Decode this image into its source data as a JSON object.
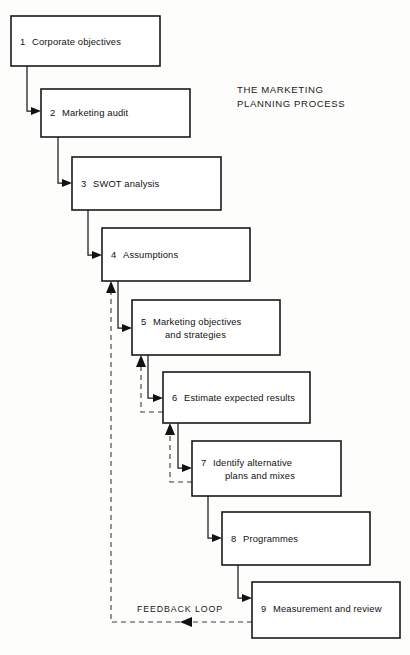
{
  "figure": {
    "title_line1": "THE MARKETING",
    "title_line2": "PLANNING PROCESS",
    "feedback_label": "FEEDBACK LOOP",
    "ink_color": "#1a1a1a",
    "background_color": "#fdfdfc"
  },
  "steps": [
    {
      "number": "1",
      "line1": "Corporate objectives",
      "line2": ""
    },
    {
      "number": "2",
      "line1": "Marketing audit",
      "line2": ""
    },
    {
      "number": "3",
      "line1": "SWOT analysis",
      "line2": ""
    },
    {
      "number": "4",
      "line1": "Assumptions",
      "line2": ""
    },
    {
      "number": "5",
      "line1": "Marketing objectives",
      "line2": "and strategies"
    },
    {
      "number": "6",
      "line1": "Estimate expected results",
      "line2": ""
    },
    {
      "number": "7",
      "line1": "Identify alternative",
      "line2": "plans and mixes"
    },
    {
      "number": "8",
      "line1": "Programmes",
      "line2": ""
    },
    {
      "number": "9",
      "line1": "Measurement and review",
      "line2": ""
    }
  ]
}
